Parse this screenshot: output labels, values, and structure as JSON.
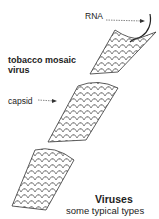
{
  "labels": {
    "rna": "RNA",
    "virus_name": "tobacco mosaic virus",
    "capsid": "capsid"
  },
  "caption": {
    "title": "Viruses",
    "subtitle": "some typical types"
  },
  "colors": {
    "line": "#333333",
    "background": "#ffffff"
  }
}
